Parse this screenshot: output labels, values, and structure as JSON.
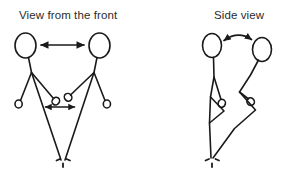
{
  "page": {
    "background_color": "#ffffff",
    "width": 284,
    "height": 179
  },
  "diagram": {
    "kind": "line-drawing",
    "stroke_color": "#1a1a1a",
    "text_color": "#2b2b2b"
  },
  "panels": [
    {
      "id": "front",
      "title": "View from the front",
      "figures": 2,
      "annotations": [
        {
          "name": "head-distance-arrow",
          "style": "double-headed straight arrow",
          "between": "the two heads"
        },
        {
          "name": "hand-distance-arrow",
          "style": "double-headed straight arrow",
          "between": "the two inner hands"
        }
      ],
      "ground_mark": "dashed floor tick"
    },
    {
      "id": "side",
      "title": "Side view",
      "figures": 2,
      "annotations": [
        {
          "name": "head-distance-arrow",
          "style": "double-headed curved arrow",
          "between": "the two heads"
        }
      ],
      "ground_mark": "dashed floor tick"
    }
  ],
  "labels": {
    "front_title": "View from the front",
    "side_title": "Side view"
  }
}
